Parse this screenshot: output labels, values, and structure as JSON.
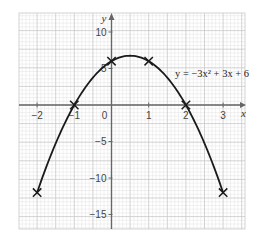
{
  "chart_data": {
    "type": "line",
    "title": "",
    "equation": "y = −3x² + 3x + 6",
    "xlabel": "x",
    "ylabel": "y",
    "xlim": [
      -2.5,
      3.6
    ],
    "ylim": [
      -17,
      12.5
    ],
    "grid": true,
    "legend": null,
    "x_ticks": [
      -2,
      -1,
      0,
      1,
      2,
      3
    ],
    "x_tick_labels": [
      "−2",
      "−1",
      "0",
      "1",
      "2",
      "3"
    ],
    "y_ticks": [
      10,
      5,
      -5,
      -10,
      -15
    ],
    "y_tick_labels": [
      "10",
      "5",
      "−5",
      "−10",
      "−15"
    ],
    "series": [
      {
        "name": "y = −3x² + 3x + 6",
        "kind": "curve",
        "x_range": [
          -2,
          3
        ],
        "coefficients": {
          "a": -3,
          "b": 3,
          "c": 6
        }
      },
      {
        "name": "plotted points",
        "kind": "markers",
        "marker": "x",
        "x": [
          -2,
          -1,
          0,
          1,
          2,
          3
        ],
        "y": [
          -12,
          0,
          6,
          6,
          0,
          -12
        ]
      }
    ],
    "vertex": {
      "x": 0.5,
      "y": 6.75
    }
  },
  "colors": {
    "grid_minor": "#e2e2e2",
    "grid_major": "#c8c8c8",
    "axis": "#666666",
    "curve": "#1a1a1a",
    "marker": "#1a1a1a"
  }
}
